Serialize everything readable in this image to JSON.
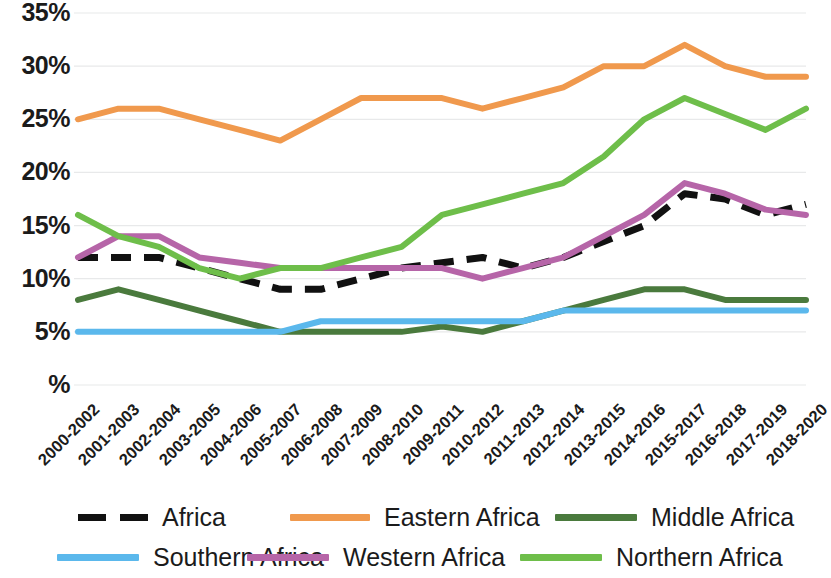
{
  "chart_data": {
    "type": "line",
    "title": "",
    "subtitle": "",
    "xlabel": "",
    "ylabel": "%",
    "ylim": [
      0,
      35
    ],
    "ytick_labels": [
      "35%",
      "30%",
      "25%",
      "20%",
      "15%",
      "10%",
      "5%",
      "%"
    ],
    "ytick_values": [
      35,
      30,
      25,
      20,
      15,
      10,
      5,
      0
    ],
    "grid": true,
    "legend_position": "bottom",
    "categories": [
      "2000-2002",
      "2001-2003",
      "2002-2004",
      "2003-2005",
      "2004-2006",
      "2005-2007",
      "2006-2008",
      "2007-2009",
      "2008-2010",
      "2009-2011",
      "2010-2012",
      "2011-2013",
      "2012-2014",
      "2013-2015",
      "2014-2016",
      "2015-2017",
      "2016-2018",
      "2017-2019",
      "2018-2020"
    ],
    "series": [
      {
        "name": "Africa",
        "color": "#111111",
        "style": "dashed",
        "values": [
          12,
          12,
          12,
          11,
          10,
          9,
          9,
          10,
          11,
          11.5,
          12,
          11,
          12,
          13.5,
          15,
          18,
          17.5,
          16,
          17
        ]
      },
      {
        "name": "Eastern Africa",
        "color": "#F0994D",
        "style": "solid",
        "values": [
          25,
          26,
          26,
          25,
          24,
          23,
          25,
          27,
          27,
          27,
          26,
          27,
          28,
          30,
          30,
          32,
          30,
          29,
          29
        ]
      },
      {
        "name": "Middle Africa",
        "color": "#4A7A3D",
        "style": "solid",
        "values": [
          8,
          9,
          8,
          7,
          6,
          5,
          5,
          5,
          5,
          5.5,
          5,
          6,
          7,
          8,
          9,
          9,
          8,
          8,
          8
        ]
      },
      {
        "name": "Southern Africa",
        "color": "#5BB8EC",
        "style": "solid",
        "values": [
          5,
          5,
          5,
          5,
          5,
          5,
          6,
          6,
          6,
          6,
          6,
          6,
          7,
          7,
          7,
          7,
          7,
          7,
          7
        ]
      },
      {
        "name": "Western Africa",
        "color": "#B665A8",
        "style": "solid",
        "values": [
          12,
          14,
          14,
          12,
          11.5,
          11,
          11,
          11,
          11,
          11,
          10,
          11,
          12,
          14,
          16,
          19,
          18,
          16.5,
          16
        ]
      },
      {
        "name": "Northern Africa",
        "color": "#6EBE4A",
        "style": "solid",
        "values": [
          16,
          14,
          13,
          11,
          10,
          11,
          11,
          12,
          13,
          16,
          17,
          18,
          19,
          21.5,
          25,
          27,
          25.5,
          24,
          26
        ]
      }
    ]
  },
  "legend": {
    "rows": [
      [
        {
          "label": "Africa",
          "color": "#111111",
          "style": "dashed"
        },
        {
          "label": "Eastern Africa",
          "color": "#F0994D",
          "style": "solid"
        },
        {
          "label": "Middle Africa",
          "color": "#4A7A3D",
          "style": "solid"
        }
      ],
      [
        {
          "label": "Southern Africa",
          "color": "#5BB8EC",
          "style": "solid"
        },
        {
          "label": "Western Africa",
          "color": "#B665A8",
          "style": "solid"
        },
        {
          "label": "Northern Africa",
          "color": "#6EBE4A",
          "style": "solid"
        }
      ]
    ]
  }
}
